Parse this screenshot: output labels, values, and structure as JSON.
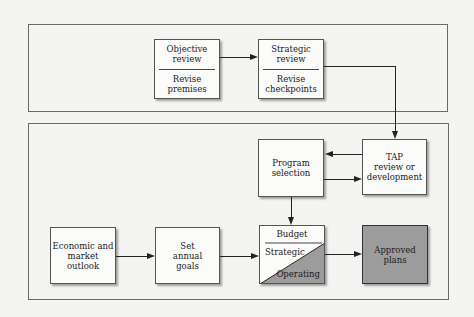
{
  "diagram": {
    "top_group": {
      "objective": {
        "top": "Objective\nreview",
        "bottom": "Revise\npremises"
      },
      "strategic": {
        "top": "Strategic\nreview",
        "bottom": "Revise\ncheckpoints"
      }
    },
    "bottom_group": {
      "program": "Program\nselection",
      "tap": "TAP\nreview or\ndevelopment",
      "economic": "Economic and\nmarket\noutlook",
      "goals": "Set\nannual\ngoals",
      "budget": {
        "title": "Budget",
        "strategic": "Strategic",
        "operating": "Operating"
      },
      "approved": "Approved\nplans"
    },
    "colors": {
      "box_fill": "#fbfbfa",
      "dark_fill": "#9c9c9c",
      "line": "#222222"
    }
  }
}
